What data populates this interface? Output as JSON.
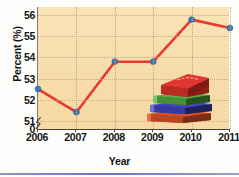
{
  "chart_data": {
    "type": "line",
    "title": "",
    "xlabel": "Year",
    "ylabel": "Percent (%)",
    "categories": [
      "2006",
      "2007",
      "2008",
      "2009",
      "2010",
      "2011"
    ],
    "values": [
      52.5,
      51.4,
      53.8,
      53.8,
      55.8,
      55.4
    ],
    "series": [
      {
        "name": "Percent",
        "values": [
          52.5,
          51.4,
          53.8,
          53.8,
          55.8,
          55.4
        ]
      }
    ],
    "x_tick_labels": [
      "2006",
      "2007",
      "2008",
      "2009",
      "2010",
      "2011"
    ],
    "y_tick_labels": [
      "56",
      "55",
      "54",
      "53",
      "52",
      "51",
      "0"
    ],
    "ylim": [
      50.6,
      56.4
    ],
    "y_axis_break": true,
    "y_axis_break_label": "0",
    "grid": true,
    "grid_style": "dotted",
    "legend": "none",
    "legend_position": "none",
    "annotations": [
      "stack-of-books-illustration"
    ]
  },
  "style": {
    "plot_background": "#f7dcab",
    "line_color": "#e8392c",
    "marker_color": "#3d7cb5",
    "marker_edge_color": "#2b5d8e",
    "grid_color": "#c0a983",
    "axis_color": "#4a4338",
    "text_color": "#151515",
    "page_background": "#fdfdfb",
    "bottom_rule_color": "#6f74b8"
  },
  "illustration": {
    "name": "stack-of-books",
    "books": [
      {
        "label": "book-top-red",
        "color": "#e0342e",
        "spine_color": "#a2231f"
      },
      {
        "label": "book-green",
        "color": "#4f9b3f",
        "spine_color": "#2f6526"
      },
      {
        "label": "book-blue",
        "color": "#3b3fa6",
        "spine_color": "#262a72"
      },
      {
        "label": "book-bottom-orange",
        "color": "#d4502a",
        "spine_color": "#94341a"
      }
    ]
  }
}
